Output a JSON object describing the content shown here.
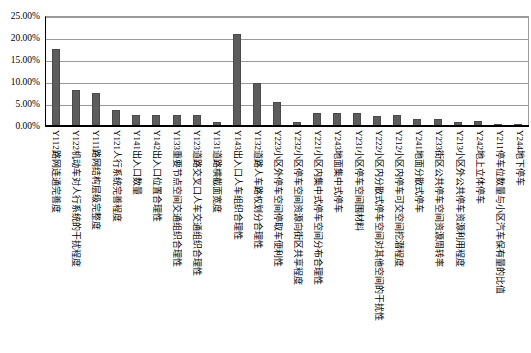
{
  "chart_data": {
    "type": "bar",
    "title": "",
    "xlabel": "",
    "ylabel": "",
    "ylim": [
      0,
      0.25
    ],
    "ytick_labels": [
      "0.00%",
      "5.00%",
      "10.00%",
      "15.00%",
      "20.00%",
      "25.00%"
    ],
    "ytick_values": [
      0,
      5,
      10,
      15,
      20,
      25
    ],
    "grid": true,
    "legend": "none",
    "bar_color": "#5c5c5c",
    "categories": [
      "Y112路网连通完善度",
      "Y122机动车对人行系统的干扰程度",
      "Y111路网结构层级完整度",
      "Y121人行系统完善程度",
      "Y141出入口数量",
      "Y142出入口位置合理性",
      "Y133重要节点空间交通组织合理性",
      "Y123道路交叉口人车交通组织合理性",
      "Y131道路横截面宽度",
      "Y143出入口人车组织合理性",
      "Y132道路人车路权划分合理性",
      "Y223小区外停车空间停取车便利性",
      "Y232小区停车空间资源向街区共享程度",
      "Y221小区内集中式停车空间分布合理性",
      "Y243地面集中式停车",
      "Y231小区停车空间围材料",
      "Y222小区内分散式停车空间对其他空间的干扰性",
      "Y212小区内停车可交空间挖潜程度",
      "Y241地面分散式停车",
      "Y233街区公共停车空间资源周转率",
      "Y213小区外公共停车资源利用程度",
      "Y242地上立体停车",
      "Y211停车位数量与小区汽车保有量的比值",
      "Y244地下停车"
    ],
    "values": [
      17.6,
      8.2,
      7.4,
      3.6,
      2.5,
      2.5,
      2.6,
      2.5,
      1.0,
      21.0,
      9.8,
      5.4,
      0.8,
      2.9,
      3.0,
      2.9,
      2.3,
      2.4,
      1.5,
      1.5,
      1.0,
      1.1,
      0.3,
      0.2
    ]
  }
}
